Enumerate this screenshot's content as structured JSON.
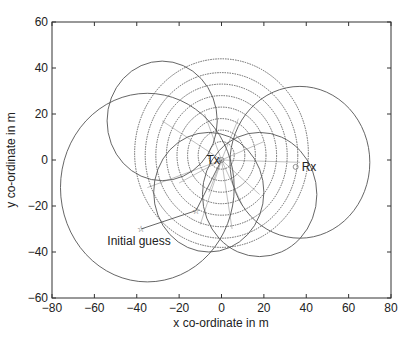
{
  "chart_data": {
    "type": "scatter",
    "title": "",
    "xlabel": "x co-ordinate in m",
    "ylabel": "y co-ordinate in m",
    "xlim": [
      -80,
      80
    ],
    "ylim": [
      -60,
      60
    ],
    "xticks": [
      -80,
      -60,
      -40,
      -20,
      0,
      20,
      40,
      60,
      80
    ],
    "yticks": [
      -60,
      -40,
      -20,
      0,
      20,
      40,
      60
    ],
    "grid": false,
    "legend": null,
    "annotations": [
      {
        "text": "Tx",
        "x": 0,
        "y": 0
      },
      {
        "text": "Rx",
        "x": 35,
        "y": -3
      },
      {
        "text": "Initial guess",
        "x": -38,
        "y": -30
      }
    ],
    "points": [
      {
        "name": "Tx",
        "x": 0,
        "y": 0,
        "marker": "circle"
      },
      {
        "name": "Rx",
        "x": 35,
        "y": -3,
        "marker": "circle"
      },
      {
        "name": "Initial guess",
        "x": -38,
        "y": -30,
        "marker": "star"
      },
      {
        "name": "Iterate",
        "x": -12,
        "y": -22,
        "marker": "star"
      }
    ],
    "solid_circles": [
      {
        "cx": -35,
        "cy": -12,
        "r": 41
      },
      {
        "cx": -28,
        "cy": 17,
        "r": 26
      },
      {
        "cx": 37,
        "cy": -1,
        "r": 33
      },
      {
        "cx": -6,
        "cy": -14,
        "r": 26
      },
      {
        "cx": 18,
        "cy": -15,
        "r": 27
      }
    ],
    "dotted_circles": [
      {
        "cx": 0,
        "cy": 2,
        "r": 6
      },
      {
        "cx": 0,
        "cy": 2,
        "r": 11
      },
      {
        "cx": 0,
        "cy": 2,
        "r": 16
      },
      {
        "cx": 0,
        "cy": 2,
        "r": 21
      },
      {
        "cx": 0,
        "cy": 2,
        "r": 26
      },
      {
        "cx": 0,
        "cy": 2,
        "r": 31
      },
      {
        "cx": 0,
        "cy": 2,
        "r": 36
      },
      {
        "cx": 0,
        "cy": 3,
        "r": 41
      }
    ],
    "rays_from_tx": [
      [
        -28,
        17
      ],
      [
        -35,
        -12
      ],
      [
        37,
        -1
      ],
      [
        -6,
        -14
      ],
      [
        18,
        -15
      ],
      [
        -8,
        20
      ],
      [
        8,
        18
      ],
      [
        10,
        -20
      ],
      [
        -20,
        -10
      ],
      [
        20,
        8
      ],
      [
        -10,
        -28
      ],
      [
        5,
        -30
      ]
    ],
    "path": [
      [
        -38,
        -30
      ],
      [
        -12,
        -22
      ],
      [
        0,
        0
      ]
    ]
  },
  "labels": {
    "tx": "Tx",
    "rx": "Rx",
    "initial_guess": "Initial guess",
    "xlabel": "x co-ordinate in m",
    "ylabel": "y co-ordinate in m"
  }
}
